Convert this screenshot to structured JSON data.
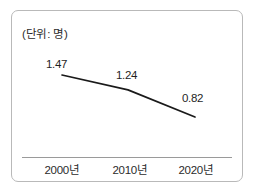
{
  "figure": {
    "unit_label": "(단위: 명)",
    "frame_color": "#b9b9b9",
    "background_color": "#ffffff"
  },
  "chart_data": {
    "type": "line",
    "title": "",
    "subtitle": "",
    "xlabel": "",
    "ylabel": "",
    "unit_note": "(단위: 명)",
    "categories": [
      "2000년",
      "2010년",
      "2020년"
    ],
    "values": [
      1.47,
      1.24,
      0.82
    ],
    "point_labels": [
      "1.47",
      "1.24",
      "0.82"
    ],
    "series": [
      {
        "name": "",
        "values": [
          1.47,
          1.24,
          0.82
        ],
        "color": "#1a1a1a"
      }
    ],
    "ylim": [
      0,
      1.6
    ],
    "grid": false,
    "legend": false,
    "legend_position": "none",
    "axis_line_color": "#9a9a9a",
    "markers": false
  }
}
